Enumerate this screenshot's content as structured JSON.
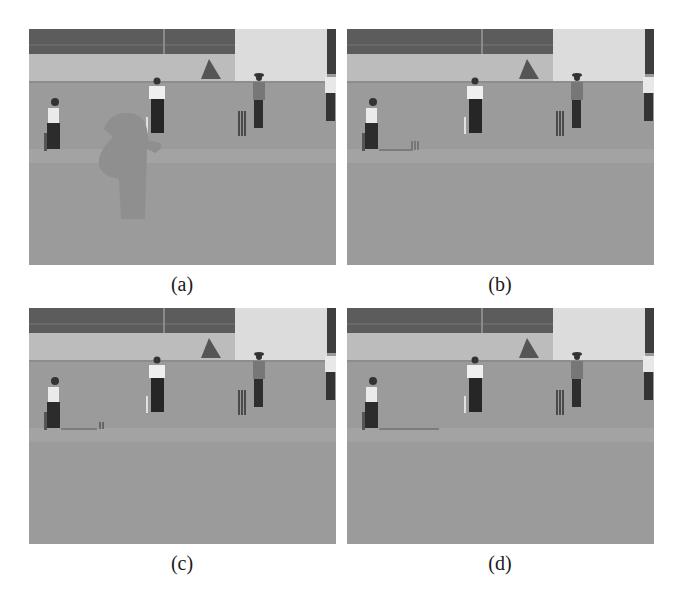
{
  "figure": {
    "panels": [
      {
        "id": "a",
        "caption": "(a)",
        "description": "Cricket scene with a large grey occluding object mask over the pitch area"
      },
      {
        "id": "b",
        "caption": "(b)",
        "description": "Cricket scene with occlusion removed; faint artifacts near the batsman's stumps"
      },
      {
        "id": "c",
        "caption": "(c)",
        "description": "Cricket scene with occlusion removed; small artifact near the batsman's stumps"
      },
      {
        "id": "d",
        "caption": "(d)",
        "description": "Cricket scene, original / reference frame without occlusion"
      }
    ],
    "scene_colors": {
      "fence": "#5c5c5c",
      "wall": "#bcbcbc",
      "building": "#d9d9d9",
      "grass": "#9b9b9b",
      "mask": "#8f8f8f"
    }
  }
}
